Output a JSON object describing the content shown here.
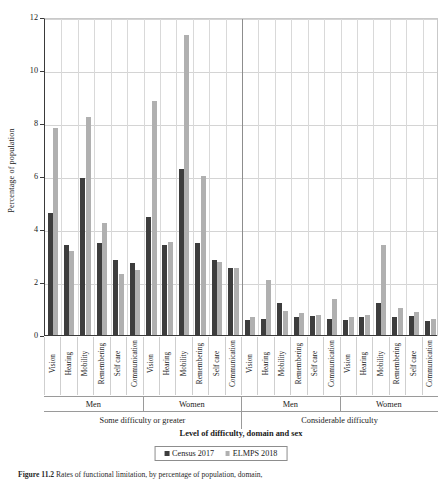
{
  "chart_data": {
    "type": "bar",
    "title": "",
    "xlabel": "Level of difficulty, domain and sex",
    "ylabel": "Percentage of population",
    "ylim": [
      0,
      12
    ],
    "yticks": [
      0,
      2,
      4,
      6,
      8,
      10,
      12
    ],
    "grid": true,
    "legend_position": "bottom",
    "legend": [
      "Census 2017",
      "ELMPS 2018"
    ],
    "colors": {
      "census": "#3d3d3d",
      "elmps": "#b0b0b0"
    },
    "domains": [
      "Vision",
      "Hearing",
      "Mobility",
      "Remembering",
      "Self care",
      "Communication"
    ],
    "sex_groups": [
      "Men",
      "Women"
    ],
    "difficulty_groups": [
      "Some difficulty or greater",
      "Considerable difficulty"
    ],
    "categories": [
      "Some difficulty or greater / Men / Vision",
      "Some difficulty or greater / Men / Hearing",
      "Some difficulty or greater / Men / Mobility",
      "Some difficulty or greater / Men / Remembering",
      "Some difficulty or greater / Men / Self care",
      "Some difficulty or greater / Men / Communication",
      "Some difficulty or greater / Women / Vision",
      "Some difficulty or greater / Women / Hearing",
      "Some difficulty or greater / Women / Mobility",
      "Some difficulty or greater / Women / Remembering",
      "Some difficulty or greater / Women / Self care",
      "Some difficulty or greater / Women / Communication",
      "Considerable difficulty / Men / Vision",
      "Considerable difficulty / Men / Hearing",
      "Considerable difficulty / Men / Mobility",
      "Considerable difficulty / Men / Remembering",
      "Considerable difficulty / Men / Self care",
      "Considerable difficulty / Men / Communication",
      "Considerable difficulty / Women / Vision",
      "Considerable difficulty / Women / Hearing",
      "Considerable difficulty / Women / Mobility",
      "Considerable difficulty / Women / Remembering",
      "Considerable difficulty / Women / Self care",
      "Considerable difficulty / Women / Communication"
    ],
    "series": [
      {
        "name": "Census 2017",
        "color": "#3d3d3d",
        "values": [
          4.65,
          3.45,
          5.95,
          3.5,
          2.85,
          2.75,
          4.5,
          3.45,
          6.3,
          3.5,
          2.85,
          2.55,
          0.6,
          0.65,
          1.25,
          0.7,
          0.75,
          0.65,
          0.6,
          0.7,
          1.25,
          0.7,
          0.75,
          0.55
        ]
      },
      {
        "name": "ELMPS 2018",
        "color": "#b0b0b0",
        "values": [
          7.85,
          3.2,
          8.25,
          4.25,
          2.35,
          2.5,
          8.85,
          3.55,
          11.35,
          6.05,
          2.8,
          2.55,
          0.7,
          2.1,
          0.95,
          0.85,
          0.8,
          1.4,
          0.7,
          0.8,
          3.45,
          1.05,
          0.9,
          0.65
        ]
      }
    ]
  },
  "caption": {
    "figure_number": "Figure 11.2",
    "text": "Rates of functional limitation, by percentage of population, domain,"
  }
}
